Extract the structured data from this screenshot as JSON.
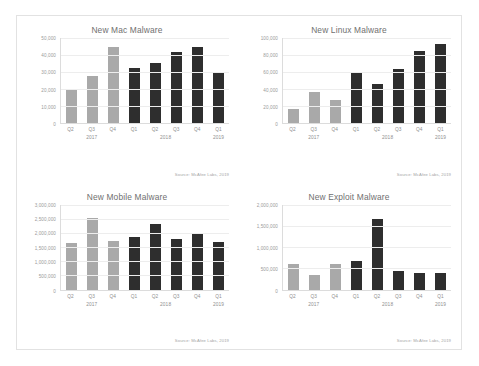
{
  "page": {
    "background_color": "#ffffff",
    "frame_border_color": "#e2e2e2"
  },
  "palette": {
    "bar_2017": "#a9a9a9",
    "bar_2018": "#2e2e2e",
    "bar_2019": "#2e2e2e",
    "title_color": "#6f6f6f",
    "axis_text_color": "#9a9a9a",
    "gridline_color": "#ededed"
  },
  "source_note": "Source: McAfee Labs, 2019",
  "charts": [
    {
      "id": "mac",
      "chart_data": {
        "type": "bar",
        "title": "New Mac Malware",
        "xlabel": "",
        "ylabel": "",
        "ylim": [
          0,
          50000
        ],
        "ytick_values": [
          0,
          10000,
          20000,
          30000,
          40000,
          50000
        ],
        "ytick_labels": [
          "0",
          "10,000",
          "20,000",
          "30,000",
          "40,000",
          "50,000"
        ],
        "grid": true,
        "legend": "none",
        "categories": [
          "Q2",
          "Q3",
          "Q4",
          "Q1",
          "Q2",
          "Q3",
          "Q4",
          "Q1"
        ],
        "years": [
          "2017",
          "2017",
          "2017",
          "2018",
          "2018",
          "2018",
          "2018",
          "2019"
        ],
        "year_groups": [
          {
            "label": "2017",
            "span": 3
          },
          {
            "label": "2018",
            "span": 4
          },
          {
            "label": "2019",
            "span": 1
          }
        ],
        "values": [
          20000,
          27500,
          44500,
          32500,
          35500,
          42000,
          45000,
          30000
        ],
        "source": "Source: McAfee Labs, 2019"
      }
    },
    {
      "id": "linux",
      "chart_data": {
        "type": "bar",
        "title": "New Linux Malware",
        "xlabel": "",
        "ylabel": "",
        "ylim": [
          0,
          100000
        ],
        "ytick_values": [
          0,
          20000,
          40000,
          60000,
          80000,
          100000
        ],
        "ytick_labels": [
          "0",
          "20,000",
          "40,000",
          "60,000",
          "80,000",
          "100,000"
        ],
        "grid": true,
        "legend": "none",
        "categories": [
          "Q2",
          "Q3",
          "Q4",
          "Q1",
          "Q2",
          "Q3",
          "Q4",
          "Q1"
        ],
        "years": [
          "2017",
          "2017",
          "2017",
          "2018",
          "2018",
          "2018",
          "2018",
          "2019"
        ],
        "year_groups": [
          {
            "label": "2017",
            "span": 3
          },
          {
            "label": "2018",
            "span": 4
          },
          {
            "label": "2019",
            "span": 1
          }
        ],
        "values": [
          17000,
          36000,
          27000,
          60000,
          46000,
          63000,
          85000,
          93000
        ],
        "source": "Source: McAfee Labs, 2019"
      }
    },
    {
      "id": "mobile",
      "chart_data": {
        "type": "bar",
        "title": "New Mobile Malware",
        "xlabel": "",
        "ylabel": "",
        "ylim": [
          0,
          3000000
        ],
        "ytick_values": [
          0,
          500000,
          1000000,
          1500000,
          2000000,
          2500000,
          3000000
        ],
        "ytick_labels": [
          "0",
          "500,000",
          "1,000,000",
          "1,500,000",
          "2,000,000",
          "2,500,000",
          "3,000,000"
        ],
        "grid": true,
        "legend": "none",
        "categories": [
          "Q2",
          "Q3",
          "Q4",
          "Q1",
          "Q2",
          "Q3",
          "Q4",
          "Q1"
        ],
        "years": [
          "2017",
          "2017",
          "2017",
          "2018",
          "2018",
          "2018",
          "2018",
          "2019"
        ],
        "year_groups": [
          {
            "label": "2017",
            "span": 3
          },
          {
            "label": "2018",
            "span": 4
          },
          {
            "label": "2019",
            "span": 1
          }
        ],
        "values": [
          1650000,
          2530000,
          1700000,
          1870000,
          2320000,
          1790000,
          1950000,
          1680000
        ],
        "source": "Source: McAfee Labs, 2019"
      }
    },
    {
      "id": "exploit",
      "chart_data": {
        "type": "bar",
        "title": "New Exploit Malware",
        "xlabel": "",
        "ylabel": "",
        "ylim": [
          0,
          2000000
        ],
        "ytick_values": [
          0,
          500000,
          1000000,
          1500000,
          2000000
        ],
        "ytick_labels": [
          "0",
          "500,000",
          "1,000,000",
          "1,500,000",
          "2,000,000"
        ],
        "grid": true,
        "legend": "none",
        "categories": [
          "Q2",
          "Q3",
          "Q4",
          "Q1",
          "Q2",
          "Q3",
          "Q4",
          "Q1"
        ],
        "years": [
          "2017",
          "2017",
          "2017",
          "2018",
          "2018",
          "2018",
          "2018",
          "2019"
        ],
        "year_groups": [
          {
            "label": "2017",
            "span": 3
          },
          {
            "label": "2018",
            "span": 4
          },
          {
            "label": "2019",
            "span": 1
          }
        ],
        "values": [
          590000,
          330000,
          590000,
          680000,
          1660000,
          430000,
          400000,
          390000
        ],
        "source": "Source: McAfee Labs, 2019"
      }
    }
  ]
}
